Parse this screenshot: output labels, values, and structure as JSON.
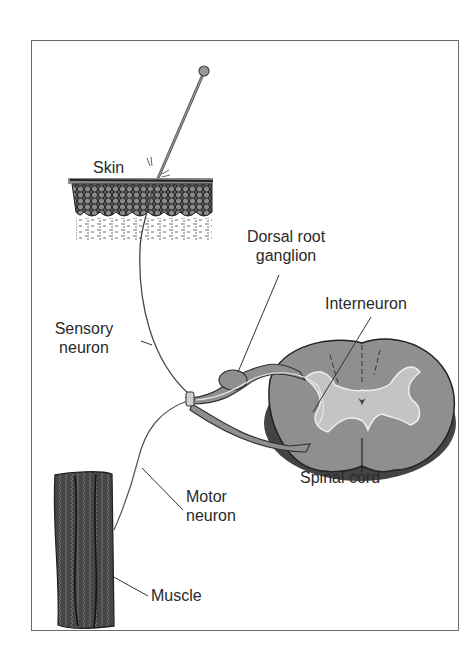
{
  "diagram": {
    "type": "anatomical illustration",
    "colors": {
      "frame": "#6b6b6b",
      "tissue_gray": "#8f8f8f",
      "light_gray": "#c4c4c4",
      "ink": "#2a2a2a"
    },
    "labels": {
      "skin": "Skin",
      "dorsal_root_ganglion_line1": "Dorsal root",
      "dorsal_root_ganglion_line2": "ganglion",
      "interneuron": "Interneuron",
      "sensory_neuron_line1": "Sensory",
      "sensory_neuron_line2": "neuron",
      "spinal_cord": "Spinal cord",
      "motor_neuron_line1": "Motor",
      "motor_neuron_line2": "neuron",
      "muscle": "Muscle"
    },
    "components": [
      {
        "id": "pin",
        "description": "Pin piercing the skin"
      },
      {
        "id": "skin",
        "description": "Cross-section of skin layers"
      },
      {
        "id": "sensory-neuron",
        "description": "Nerve fiber from skin to dorsal root ganglion"
      },
      {
        "id": "dorsal-root-ganglion",
        "description": "Swelling on dorsal root"
      },
      {
        "id": "spinal-cord",
        "description": "Cross-section with butterfly-shaped gray matter"
      },
      {
        "id": "interneuron",
        "description": "Connects sensory and motor neurons within the spinal cord"
      },
      {
        "id": "motor-neuron",
        "description": "Nerve fiber from spinal cord to muscle"
      },
      {
        "id": "muscle",
        "description": "Striated muscle fibers"
      }
    ]
  }
}
